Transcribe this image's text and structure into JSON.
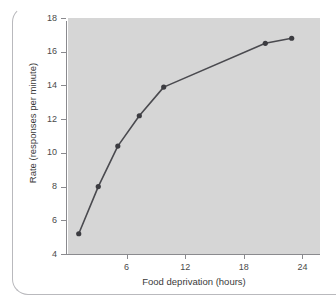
{
  "caption": {
    "fragment": "····· ·· ········ ·· ········"
  },
  "colors": {
    "plot_background": "#d6d6d6",
    "page_background": "#ffffff",
    "line": "#4a4a4f",
    "marker": "#3c3c41",
    "axis": "#8a8a8e",
    "text": "#3a3a3a",
    "frame": "#b9b9bd"
  },
  "chart_data": {
    "type": "line",
    "title": "",
    "xlabel": "Food deprivation (hours)",
    "ylabel": "Rate (responses per minute)",
    "xlim": [
      0,
      25.8
    ],
    "ylim": [
      4,
      18
    ],
    "xticks": [
      6,
      12,
      18,
      24
    ],
    "yticks": [
      4,
      6,
      8,
      10,
      12,
      14,
      16,
      18
    ],
    "grid": false,
    "legend": null,
    "markers": true,
    "series": [
      {
        "name": "Response rate",
        "x": [
          1.1,
          3.1,
          5.1,
          7.3,
          9.8,
          20.2,
          22.9
        ],
        "y": [
          5.2,
          8.0,
          10.4,
          12.2,
          13.9,
          16.5,
          16.8
        ]
      }
    ]
  }
}
